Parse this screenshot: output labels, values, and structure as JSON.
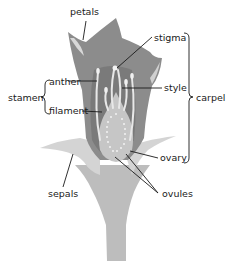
{
  "diagram": {
    "colors": {
      "background": "#ffffff",
      "petal": "#8a8a8a",
      "petal_highlight": "#d6d6d6",
      "inner_dark": "#6f6f6f",
      "receptacle": "#bdbdbd",
      "sepal": "#cfcfcf",
      "stamen": "#e8e8e8",
      "ovary": "#c4c4c4",
      "ovule": "#f2f2f2",
      "leader_line": "#1a1a1a",
      "text": "#1a1a1a"
    },
    "labels": {
      "petals": "petals",
      "stigma": "stigma",
      "anther": "anther",
      "style": "style",
      "stamen": "stamen",
      "filament": "filament",
      "carpel": "carpel",
      "ovary": "ovary",
      "sepals": "sepals",
      "ovules": "ovules"
    }
  }
}
